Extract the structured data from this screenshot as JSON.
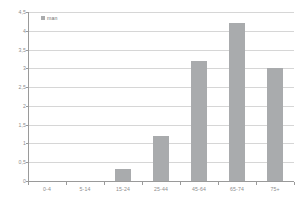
{
  "chart_data": {
    "type": "bar",
    "title": "",
    "xlabel": "",
    "ylabel": "",
    "categories": [
      "0-4",
      "5-14",
      "15-24",
      "25-44",
      "45-64",
      "65-74",
      "75+"
    ],
    "values": [
      0,
      0,
      0.33,
      1.2,
      3.2,
      4.2,
      3.0
    ],
    "series": [
      {
        "name": "man",
        "values": [
          0,
          0,
          0.33,
          1.2,
          3.2,
          4.2,
          3.0
        ],
        "color": "#a9abad"
      }
    ],
    "ylim": [
      0,
      4.5
    ],
    "ytick_values": [
      0,
      0.5,
      1,
      1.5,
      2,
      2.5,
      3,
      3.5,
      4,
      4.5
    ],
    "ytick_labels": [
      "0",
      "0,5",
      "1",
      "1,5",
      "2",
      "2,5",
      "3",
      "3,5",
      "4",
      "4,5"
    ],
    "grid": true,
    "grid_color": "#d6d6d6",
    "legend": {
      "position": "top-left",
      "entries": [
        {
          "label": "man",
          "color": "#a9abad"
        }
      ]
    },
    "axis_color": "#9a9a9a",
    "text_color": "#8d8d8d",
    "background": "#ffffff"
  }
}
